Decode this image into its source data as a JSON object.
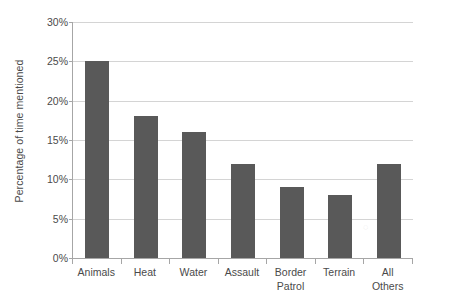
{
  "chart_data": {
    "type": "bar",
    "title": "",
    "xlabel": "",
    "ylabel": "Percentage of time mentioned",
    "categories": [
      "Animals",
      "Heat",
      "Water",
      "Assault",
      "Border\nPatrol",
      "Terrain",
      "All Others"
    ],
    "values": [
      25,
      18,
      16,
      12,
      9,
      8,
      12
    ],
    "ylim": [
      0,
      30
    ],
    "ytick_values": [
      0,
      5,
      10,
      15,
      20,
      25,
      30
    ],
    "ytick_labels": [
      "0%",
      "5%",
      "10%",
      "15%",
      "20%",
      "25%",
      "30%"
    ],
    "grid": true,
    "legend": false,
    "bar_color": "#595959",
    "gridline_color": "#d4d4d4",
    "axis_color": "#a6a6a6",
    "background_color": "#ffffff",
    "value_suffix": "%"
  }
}
